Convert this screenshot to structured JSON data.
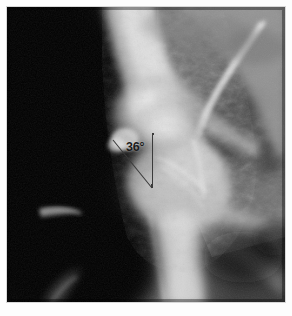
{
  "figure": {
    "name": "hip-radiograph",
    "modality": "X-ray",
    "region": "hip joint",
    "background_color": "#ffffff",
    "film_color": "#050505",
    "frame": {
      "x": 7,
      "y": 7,
      "width": 278,
      "height": 295
    }
  },
  "annotation": {
    "angle_label": "36°",
    "angle_value": 36,
    "unit": "degrees",
    "line_color": "#3a3a3a",
    "label_color": "#1b1b1b",
    "vertex": {
      "x": 145,
      "y": 181
    },
    "reference_line": {
      "x1": 146,
      "y1": 126,
      "x2": 145,
      "y2": 181
    },
    "measured_line": {
      "x1": 106,
      "y1": 133,
      "x2": 145,
      "y2": 181
    },
    "label_position": {
      "x": 119,
      "y": 134
    }
  },
  "image_regions": [
    {
      "name": "soft-tissue-dark-left",
      "description": "dark low-density field at left of film"
    },
    {
      "name": "femoral-neck-bright",
      "description": "bright cortical bone of femoral neck"
    },
    {
      "name": "femoral-head",
      "description": "rounded bright femoral head near centre"
    },
    {
      "name": "acetabular-rim",
      "description": "bright curved acetabular rim upper right"
    },
    {
      "name": "pelvic-bone-right",
      "description": "mid-grey trabecular pelvic bone, right side"
    },
    {
      "name": "greater-trochanter",
      "description": "bright trochanteric mass lower centre"
    },
    {
      "name": "femoral-shaft",
      "description": "bright femoral shaft descending to bottom"
    },
    {
      "name": "obturator-dark-lower-left",
      "description": "dark obturator / soft tissue region lower left"
    }
  ],
  "corner_mark": {
    "text": ""
  }
}
